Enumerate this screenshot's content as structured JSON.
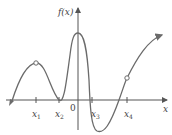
{
  "diagram": {
    "y_axis_label": "f(x)",
    "x_axis_label": "x",
    "origin_label": "0",
    "tick_labels": [
      {
        "main": "x",
        "sub": "1"
      },
      {
        "main": "x",
        "sub": "2"
      },
      {
        "main": "x",
        "sub": "3"
      },
      {
        "main": "x",
        "sub": "4"
      }
    ],
    "open_points": [
      "local max near x1 (hole)",
      "point on curve at x4 (hole)"
    ],
    "colors": {
      "curve": "#6b6b6b",
      "axis": "#555555",
      "background": "#ffffff"
    }
  }
}
